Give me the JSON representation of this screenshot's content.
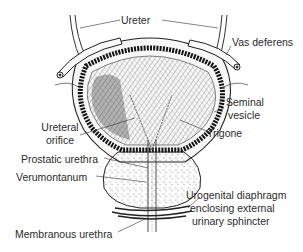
{
  "diagram": {
    "labels": {
      "ureter": "Ureter",
      "vas_deferens": "Vas deferens",
      "seminal_vesicle_1": "Seminal",
      "seminal_vesicle_2": "vesicle",
      "ureteral_orifice_1": "Ureteral",
      "ureteral_orifice_2": "orifice",
      "trigone": "Trigone",
      "prostatic_urethra": "Prostatic urethra",
      "verumontanum": "Verumontanum",
      "urogenital_1": "Urogenital diaphragm",
      "urogenital_2": "enclosing external",
      "urogenital_3": "urinary sphincter",
      "membranous_urethra": "Membranous urethra"
    },
    "colors": {
      "ink": "#1a1a1a",
      "background": "#ffffff"
    }
  }
}
